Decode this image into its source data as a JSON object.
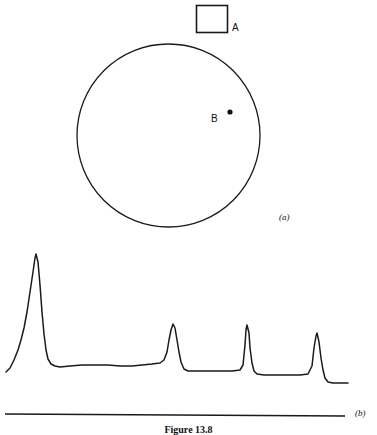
{
  "figure": {
    "caption": "Figure 13.8",
    "panel_a_tag": "(a)",
    "panel_b_tag": "(b)"
  },
  "panel_a": {
    "square_label": "A",
    "point_label": "B",
    "square": {
      "x": 196,
      "y": 5,
      "width": 32,
      "height": 28
    },
    "circle": {
      "cx": 168.5,
      "cy": 135.5,
      "r": 91.5
    },
    "point": {
      "x": 230,
      "y": 112,
      "r": 2.6
    },
    "stroke_color": "#1a1a1a"
  },
  "chart_data": {
    "type": "line",
    "title": "",
    "subtitle": "",
    "xlabel": "",
    "ylabel": "",
    "grid": false,
    "legend": "none",
    "axis_rule_y": 415,
    "axis_rule_x_start": 5,
    "axis_rule_x_end": 345,
    "xlim": [
      0,
      377
    ],
    "ylim": [
      435,
      245
    ],
    "series": [
      {
        "name": "detector-signal",
        "points": [
          [
            6,
            372
          ],
          [
            10,
            368
          ],
          [
            14,
            360
          ],
          [
            18,
            350
          ],
          [
            21,
            340
          ],
          [
            24,
            328
          ],
          [
            27,
            312
          ],
          [
            30,
            292
          ],
          [
            33,
            272
          ],
          [
            35,
            258
          ],
          [
            36,
            254
          ],
          [
            38,
            262
          ],
          [
            40,
            285
          ],
          [
            42,
            312
          ],
          [
            44,
            334
          ],
          [
            46,
            350
          ],
          [
            48,
            359
          ],
          [
            51,
            364
          ],
          [
            55,
            366
          ],
          [
            60,
            367
          ],
          [
            70,
            366
          ],
          [
            82,
            365
          ],
          [
            95,
            365
          ],
          [
            108,
            365
          ],
          [
            120,
            366
          ],
          [
            132,
            366
          ],
          [
            142,
            365
          ],
          [
            152,
            364
          ],
          [
            160,
            363
          ],
          [
            164,
            360
          ],
          [
            167,
            352
          ],
          [
            169,
            340
          ],
          [
            171,
            330
          ],
          [
            173,
            324
          ],
          [
            175,
            328
          ],
          [
            177,
            340
          ],
          [
            179,
            352
          ],
          [
            181,
            362
          ],
          [
            184,
            369
          ],
          [
            188,
            371
          ],
          [
            196,
            371
          ],
          [
            208,
            371
          ],
          [
            220,
            371
          ],
          [
            232,
            371
          ],
          [
            240,
            370
          ],
          [
            243,
            365
          ],
          [
            245,
            345
          ],
          [
            246,
            330
          ],
          [
            247,
            325
          ],
          [
            249,
            333
          ],
          [
            250,
            348
          ],
          [
            252,
            363
          ],
          [
            254,
            371
          ],
          [
            257,
            374
          ],
          [
            264,
            375
          ],
          [
            276,
            375
          ],
          [
            288,
            375
          ],
          [
            300,
            375
          ],
          [
            308,
            374
          ],
          [
            312,
            366
          ],
          [
            314,
            348
          ],
          [
            316,
            336
          ],
          [
            317,
            333
          ],
          [
            319,
            342
          ],
          [
            321,
            358
          ],
          [
            323,
            370
          ],
          [
            325,
            378
          ],
          [
            328,
            382
          ],
          [
            333,
            383
          ],
          [
            340,
            383
          ],
          [
            348,
            383
          ]
        ]
      }
    ],
    "peaks": [
      {
        "index": 1,
        "apex_x": 36,
        "apex_y": 254,
        "height_rel": 1.0,
        "width": "broad, tailing"
      },
      {
        "index": 2,
        "apex_x": 173,
        "apex_y": 324,
        "height_rel": 0.41,
        "width": "narrow"
      },
      {
        "index": 3,
        "apex_x": 247,
        "apex_y": 325,
        "height_rel": 0.4,
        "width": "very narrow"
      },
      {
        "index": 4,
        "apex_x": 317,
        "apex_y": 333,
        "height_rel": 0.35,
        "width": "narrow"
      }
    ],
    "baseline_levels": [
      366,
      371,
      375,
      383
    ],
    "stroke_color": "#1a1a1a"
  }
}
